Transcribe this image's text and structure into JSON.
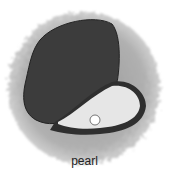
{
  "illustration": {
    "subject": "oyster with pearl",
    "caption": "pearl",
    "colors": {
      "halo": "#a8a8a8",
      "top_shell": "#3c3c3c",
      "bottom_shell_inner": "#e6e6e6",
      "bottom_shell_rim": "#2f2f2f",
      "pearl": "#ffffff"
    }
  }
}
